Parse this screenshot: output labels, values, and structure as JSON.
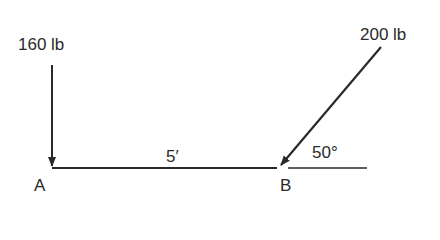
{
  "diagram": {
    "type": "beam force diagram",
    "beam": {
      "length_label": "5′",
      "left_point": "A",
      "right_point": "B"
    },
    "forces": [
      {
        "id": "force-a",
        "magnitude_label": "160 lb",
        "at": "A",
        "direction": "vertical-down"
      },
      {
        "id": "force-b",
        "magnitude_label": "200 lb",
        "at": "B",
        "direction": "diagonal-down-left",
        "angle_label": "50°"
      }
    ],
    "colors": {
      "line": "#2a2a2a",
      "background": "#ffffff"
    }
  }
}
